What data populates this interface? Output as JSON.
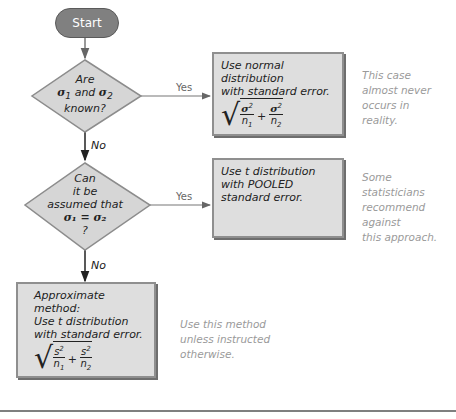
{
  "flowchart": {
    "start": "Start",
    "decision1": {
      "line1": "Are",
      "line2_a": "σ",
      "line2_sub1": "1",
      "line2_mid": " and ",
      "line2_b": "σ",
      "line2_sub2": "2",
      "line3": "known?"
    },
    "decision2": {
      "line1": "Can",
      "line2": "it be",
      "line3": "assumed that",
      "line4": "σ₁ = σ₂",
      "line5": "?"
    },
    "yes_label": "Yes",
    "no_label": "No",
    "box1": {
      "line1": "Use normal distribution",
      "line2": "with standard error.",
      "formula": "sqrt(σ1²/n1 + σ2²/n2)"
    },
    "box2": {
      "line1": "Use t distribution",
      "line2": "with POOLED",
      "line3": "standard error."
    },
    "box3": {
      "line1": "Approximate method:",
      "line2": "Use t distribution",
      "line3": "with standard error.",
      "formula": "sqrt(s1²/n1 + s2²/n2)"
    },
    "note1": [
      "This case",
      "almost never",
      "occurs in",
      "reality."
    ],
    "note2": [
      "Some",
      "statisticians",
      "recommend against",
      "this approach."
    ],
    "note3": [
      "Use this method",
      "unless instructed",
      "otherwise."
    ]
  },
  "formula_parts": {
    "sigma1": "σ",
    "sigma2": "σ",
    "s1": "s",
    "s2": "s",
    "sq": "2",
    "n1": "n",
    "n2": "n",
    "sub1": "1",
    "sub2": "2",
    "plus": "+",
    "rad": "√"
  }
}
